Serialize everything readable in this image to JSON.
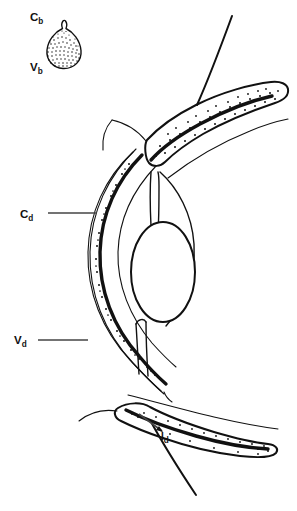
{
  "figure": {
    "type": "anatomical-line-drawing",
    "background_color": "#ffffff",
    "ink_color": "#111111",
    "leader_color": "#444444"
  },
  "labels": {
    "cb": {
      "base": "C",
      "sub": "b",
      "x": 30,
      "y": 21
    },
    "vb": {
      "base": "V",
      "sub": "b",
      "x": 30,
      "y": 71
    },
    "cd": {
      "base": "C",
      "sub": "d",
      "x": 20,
      "y": 218
    },
    "vd": {
      "base": "V",
      "sub": "d",
      "x": 14,
      "y": 340
    },
    "id": {
      "base": "I",
      "sub": "d",
      "x": 160,
      "y": 441
    }
  },
  "leaders": [
    {
      "name": "leader-cd",
      "x1": 48,
      "y1": 213,
      "x2": 97,
      "y2": 213
    },
    {
      "name": "leader-vd",
      "x1": 38,
      "y1": 340,
      "x2": 88,
      "y2": 340
    },
    {
      "name": "leader-id",
      "x1": 140,
      "y1": 415,
      "x2": 163,
      "y2": 432
    }
  ],
  "inset": {
    "name": "stippled-teardrop-inset",
    "description": "small pear/teardrop shaped densely stippled body",
    "center_x": 64,
    "center_y": 45
  },
  "structures": [
    {
      "name": "outer-sclera-curve",
      "description": "outermost thin arc of globe"
    },
    {
      "name": "stippled-choroid-band",
      "description": "dotted band between outer and inner arcs"
    },
    {
      "name": "thick-retina-line",
      "description": "heavy black arc inside stippled band"
    },
    {
      "name": "inner-vitreous-curve",
      "description": "thin inner arc of globe"
    },
    {
      "name": "upper-eyelid",
      "description": "upper stippled lid tapering to the right"
    },
    {
      "name": "lower-eyelid",
      "description": "lower stippled lid tapering to the right"
    },
    {
      "name": "lens",
      "description": "central ellipse"
    },
    {
      "name": "iris-upper",
      "description": "upper iris flap"
    },
    {
      "name": "iris-lower",
      "description": "lower iris flap"
    },
    {
      "name": "cornea",
      "description": "anterior corneal curve"
    }
  ]
}
